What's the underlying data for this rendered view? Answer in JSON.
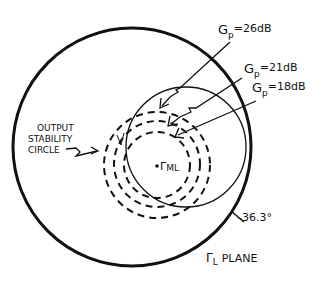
{
  "diagram": {
    "plane_label": "Γ",
    "plane_label_sub": "L",
    "plane_label_word": "PLANE",
    "angle_label": "-36.3°",
    "point_label": "Γ",
    "point_label_sub": "ML",
    "stability_label_lines": [
      "OUTPUT",
      "STABILITY",
      "CIRCLE"
    ],
    "gain_circles": [
      {
        "symbol": "G",
        "sub": "p",
        "value": "=26dB"
      },
      {
        "symbol": "G",
        "sub": "p",
        "value": "=21dB"
      },
      {
        "symbol": "G",
        "sub": "p",
        "value": "=18dB"
      }
    ],
    "colors": {
      "ink": "#111111",
      "background": "#ffffff"
    }
  }
}
